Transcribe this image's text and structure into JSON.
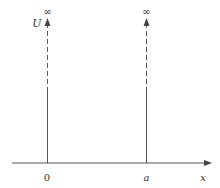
{
  "diagram": {
    "y_axis_label": "U",
    "x_axis_label": "x",
    "origin_label": "0",
    "wall_position_label": "a",
    "left_wall_infinity": "∞",
    "right_wall_infinity": "∞"
  },
  "colors": {
    "line": "#555555",
    "text": "#333333",
    "background": "#ffffff"
  }
}
